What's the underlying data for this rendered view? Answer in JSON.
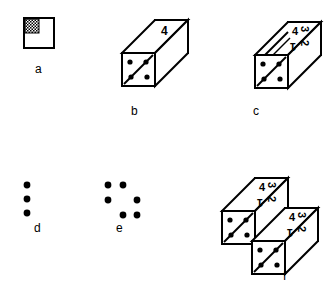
{
  "figure": {
    "title": "",
    "background_color": "#ffffff",
    "ink_color": "#000000",
    "panels": [
      {
        "id": "a",
        "label": "a",
        "type": "square-tile",
        "description": "Small square outline with hatched (cross-hatched) upper-left quadrant",
        "hatched_quadrant": "upper-left"
      },
      {
        "id": "b",
        "label": "b",
        "type": "prism",
        "description": "Elongated rectangular prism in oblique projection; far end face bears the numeral 4 in its upper-left; near end face bears a diagonal line and four dots",
        "far_face_labels": [
          "4"
        ],
        "near_face": {
          "diagonal": "lower-left-to-upper-right",
          "dots": 4
        }
      },
      {
        "id": "c",
        "label": "c",
        "type": "prism",
        "description": "Same prism as b but rotated so the far end face shows four numerals in quadrants",
        "far_face_labels": [
          "4",
          "3",
          "1",
          "2"
        ],
        "far_face_quadrants": {
          "upper_left": "4",
          "upper_right": "3",
          "lower_left": "1",
          "lower_right": "2"
        },
        "near_face": {
          "diagonal": "lower-left-to-upper-right",
          "dots": 4
        }
      },
      {
        "id": "d",
        "label": "d",
        "type": "dot-pattern",
        "description": "Three dots in a vertical column",
        "dot_count": 3
      },
      {
        "id": "e",
        "label": "e",
        "type": "dot-pattern",
        "description": "Six dots in a staggered arrangement",
        "dot_count": 6
      },
      {
        "id": "f",
        "label": "f",
        "type": "prism-pair",
        "description": "Two identical prisms stacked in a staggered/offset arrangement; each far end face shows numerals 4, 3, 1, 2 in quadrants and each near end face shows a diagonal with four dots",
        "prism_count": 2,
        "far_face_labels": [
          "4",
          "3",
          "1",
          "2"
        ],
        "near_face": {
          "diagonal": "lower-left-to-upper-right",
          "dots": 4
        }
      }
    ],
    "numerals": {
      "four": "4",
      "three": "3",
      "two": "2",
      "one": "1"
    },
    "labels": {
      "a": "a",
      "b": "b",
      "c": "c",
      "d": "d",
      "e": "e",
      "f": "f"
    }
  }
}
